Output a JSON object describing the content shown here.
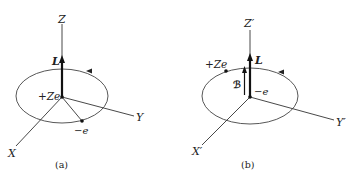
{
  "figure": {
    "panels": [
      {
        "id": "a",
        "caption": "(a)",
        "axes": {
          "z": "Z",
          "y": "Y",
          "x": "X"
        },
        "vector_label": "L",
        "nucleus_label": "+Ze",
        "electron_label": "−e",
        "orbit_direction": "counterclockwise (arrow on far side pointing left)",
        "description": "Electron (−e) orbits nucleus (+Ze) at origin; angular momentum L along Z"
      },
      {
        "id": "b",
        "caption": "(b)",
        "axes": {
          "z": "Z′",
          "y": "Y′",
          "x": "X′"
        },
        "vector_label": "L",
        "field_label": "ℬ",
        "nucleus_label": "+Ze",
        "electron_label": "−e",
        "orbit_direction": "counterclockwise (arrow on far side pointing left)",
        "description": "Frame of electron (−e) at origin; nucleus (+Ze) orbits, producing magnetic field B along L"
      }
    ],
    "colors": {
      "line": "#333333",
      "background": "#ffffff"
    }
  }
}
